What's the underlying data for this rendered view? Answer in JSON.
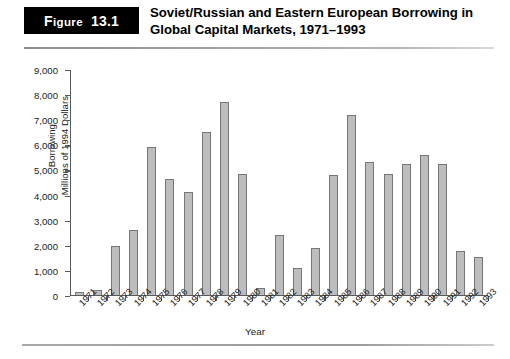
{
  "figure": {
    "tag_word": "Figure",
    "tag_number": "13.1",
    "title": "Soviet/Russian and Eastern European Borrowing in Global Capital Markets, 1971–1993"
  },
  "chart_data": {
    "type": "bar",
    "title": "Soviet/Russian and Eastern European Borrowing in Global Capital Markets, 1971–1993",
    "xlabel": "Year",
    "ylabel": "Borrowing\nMillions of 1994 Dollars",
    "ylabel_line1": "Borrowing",
    "ylabel_line2": "Millions of 1994 Dollars",
    "ylim": [
      0,
      9000
    ],
    "ytick_step": 1000,
    "ytick_labels": [
      "0",
      "1,000",
      "2,000",
      "3,000",
      "4,000",
      "5,000",
      "6,000",
      "7,000",
      "8,000",
      "9,000"
    ],
    "ytick_values": [
      0,
      1000,
      2000,
      3000,
      4000,
      5000,
      6000,
      7000,
      8000,
      9000
    ],
    "grid": false,
    "legend": null,
    "bar_color": "#bdbdbd",
    "bar_edge_color": "#767676",
    "categories": [
      "1971",
      "1972",
      "1973",
      "1974",
      "1975",
      "1976",
      "1977",
      "1978",
      "1979",
      "1980",
      "1981",
      "1982",
      "1983",
      "1984",
      "1985",
      "1986",
      "1987",
      "1988",
      "1989",
      "1990",
      "1991",
      "1992",
      "1993"
    ],
    "values": [
      120,
      200,
      1950,
      2600,
      5900,
      4650,
      4100,
      6500,
      7700,
      4850,
      250,
      2400,
      1050,
      1850,
      4800,
      7200,
      5300,
      4850,
      5250,
      5600,
      5250,
      1750,
      1500
    ]
  }
}
